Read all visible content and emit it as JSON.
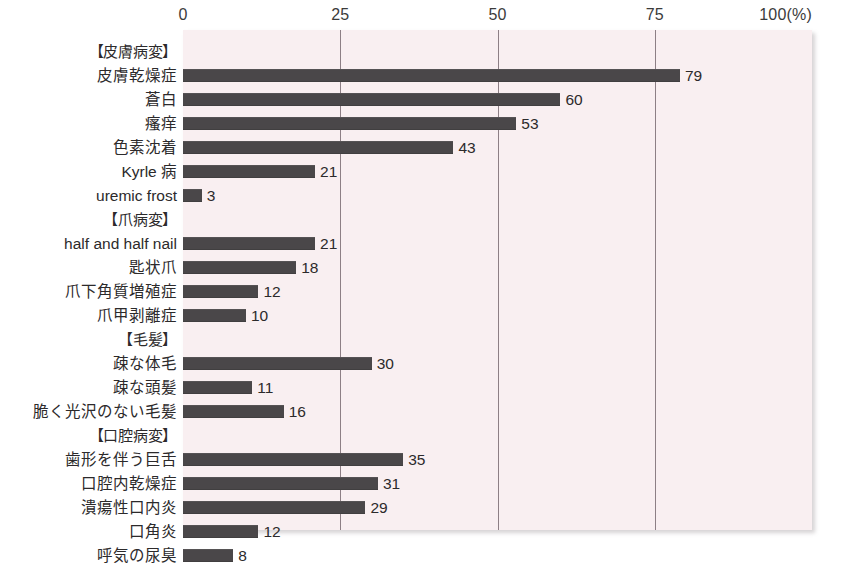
{
  "chart_data": {
    "type": "bar",
    "orientation": "horizontal",
    "title": "",
    "xlabel": "(%)",
    "ylabel": "",
    "xlim": [
      0,
      100
    ],
    "xticks": [
      0,
      25,
      50,
      75,
      100
    ],
    "xtick_labels": [
      "0",
      "25",
      "50",
      "75",
      "100(%)"
    ],
    "grid": true,
    "gridlines_at": [
      25,
      50,
      75
    ],
    "legend": null,
    "bar_color": "#4a4749",
    "plot_background": "#f9eff1",
    "categories": [
      "【皮膚病変】",
      "皮膚乾燥症",
      "蒼白",
      "瘙痒",
      "色素沈着",
      "Kyrle 病",
      "uremic frost",
      "【爪病変】",
      "half and half nail",
      "匙状爪",
      "爪下角質増殖症",
      "爪甲剥離症",
      "【毛髪】",
      "疎な体毛",
      "疎な頭髪",
      "脆く光沢のない毛髪",
      "【口腔病変】",
      "歯形を伴う巨舌",
      "口腔内乾燥症",
      "潰瘍性口内炎",
      "口角炎",
      "呼気の尿臭"
    ],
    "values": [
      null,
      79,
      60,
      53,
      43,
      21,
      3,
      null,
      21,
      18,
      12,
      10,
      null,
      30,
      11,
      16,
      null,
      35,
      31,
      29,
      12,
      8
    ],
    "rows": [
      {
        "label": "【皮膚病変】",
        "value": null,
        "value_label": "",
        "is_group": true
      },
      {
        "label": "皮膚乾燥症",
        "value": 79,
        "value_label": "79",
        "is_group": false
      },
      {
        "label": "蒼白",
        "value": 60,
        "value_label": "60",
        "is_group": false
      },
      {
        "label": "瘙痒",
        "value": 53,
        "value_label": "53",
        "is_group": false
      },
      {
        "label": "色素沈着",
        "value": 43,
        "value_label": "43",
        "is_group": false
      },
      {
        "label": "Kyrle 病",
        "value": 21,
        "value_label": "21",
        "is_group": false
      },
      {
        "label": "uremic frost",
        "value": 3,
        "value_label": "3",
        "is_group": false
      },
      {
        "label": "【爪病変】",
        "value": null,
        "value_label": "",
        "is_group": true
      },
      {
        "label": "half and half nail",
        "value": 21,
        "value_label": "21",
        "is_group": false
      },
      {
        "label": "匙状爪",
        "value": 18,
        "value_label": "18",
        "is_group": false
      },
      {
        "label": "爪下角質増殖症",
        "value": 12,
        "value_label": "12",
        "is_group": false
      },
      {
        "label": "爪甲剥離症",
        "value": 10,
        "value_label": "10",
        "is_group": false
      },
      {
        "label": "【毛髪】",
        "value": null,
        "value_label": "",
        "is_group": true
      },
      {
        "label": "疎な体毛",
        "value": 30,
        "value_label": "30",
        "is_group": false
      },
      {
        "label": "疎な頭髪",
        "value": 11,
        "value_label": "11",
        "is_group": false
      },
      {
        "label": "脆く光沢のない毛髪",
        "value": 16,
        "value_label": "16",
        "is_group": false
      },
      {
        "label": "【口腔病変】",
        "value": null,
        "value_label": "",
        "is_group": true
      },
      {
        "label": "歯形を伴う巨舌",
        "value": 35,
        "value_label": "35",
        "is_group": false
      },
      {
        "label": "口腔内乾燥症",
        "value": 31,
        "value_label": "31",
        "is_group": false
      },
      {
        "label": "潰瘍性口内炎",
        "value": 29,
        "value_label": "29",
        "is_group": false
      },
      {
        "label": "口角炎",
        "value": 12,
        "value_label": "12",
        "is_group": false
      },
      {
        "label": "呼気の尿臭",
        "value": 8,
        "value_label": "8",
        "is_group": false
      }
    ]
  },
  "caption": ""
}
